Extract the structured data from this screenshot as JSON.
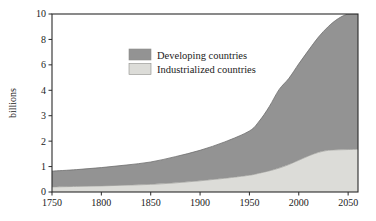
{
  "chart_data": {
    "type": "area",
    "title": "",
    "subtitle": "",
    "xlabel": "",
    "ylabel": "billions",
    "stacked": true,
    "grid": false,
    "legend_position": "inside-top-left",
    "xlim": [
      1750,
      2060
    ],
    "ylim": [
      0,
      10.4
    ],
    "x_ticks": [
      1750,
      1800,
      1850,
      1900,
      1950,
      2000,
      2050
    ],
    "x_tick_labels": [
      "1750",
      "1800",
      "1850",
      "1900",
      "1950",
      "2000",
      "2050"
    ],
    "y_ticks": [
      0,
      1,
      2,
      3,
      4,
      6,
      8,
      10
    ],
    "y_tick_labels": [
      "0",
      "1",
      "2",
      "3",
      "4",
      "6",
      "8",
      "10"
    ],
    "y_axis_note": "non-uniform spacing: equal pixel steps between 0,1,2,3,4 then between 4,6,8,10",
    "x": [
      1750,
      1775,
      1800,
      1825,
      1850,
      1875,
      1900,
      1925,
      1950,
      1960,
      1970,
      1980,
      1990,
      2000,
      2010,
      2020,
      2030,
      2040,
      2050,
      2060
    ],
    "series": [
      {
        "name": "Industrialized countries",
        "color": "#dcdcd8",
        "values": [
          0.2,
          0.22,
          0.24,
          0.27,
          0.3,
          0.36,
          0.44,
          0.54,
          0.66,
          0.74,
          0.83,
          0.94,
          1.08,
          1.25,
          1.42,
          1.56,
          1.64,
          1.66,
          1.67,
          1.68
        ]
      },
      {
        "name": "Developing countries",
        "color": "#939393",
        "values": [
          0.62,
          0.66,
          0.72,
          0.79,
          0.88,
          1.03,
          1.2,
          1.43,
          1.74,
          2.05,
          2.52,
          3.11,
          3.86,
          4.83,
          5.74,
          6.63,
          7.38,
          7.98,
          8.37,
          8.62
        ]
      }
    ],
    "totals": [
      0.82,
      0.88,
      0.96,
      1.06,
      1.18,
      1.39,
      1.64,
      1.97,
      2.4,
      2.79,
      3.35,
      4.05,
      4.94,
      6.08,
      7.16,
      8.19,
      9.02,
      9.64,
      10.04,
      10.3
    ]
  },
  "legend": {
    "items": [
      {
        "label": "Developing countries",
        "swatch_color": "#939393"
      },
      {
        "label": "Industrialized countries",
        "swatch_color": "#dcdcd8"
      }
    ]
  },
  "axes": {
    "y_title": "billions",
    "frame_color": "#2a2a2a",
    "background": "#ffffff"
  }
}
